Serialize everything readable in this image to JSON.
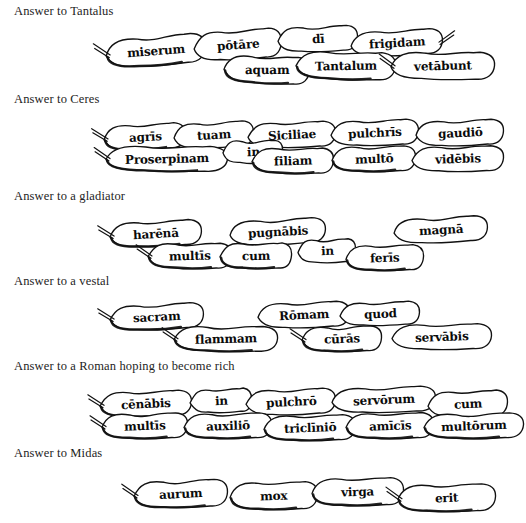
{
  "page": {
    "background_color": "#ffffff",
    "ink_color": "#111111"
  },
  "groups": [
    {
      "id": "tantalus",
      "heading": "Answer to Tantalus",
      "top": 4,
      "upper_row": [
        {
          "word": "miserum",
          "x": 104,
          "y": 16,
          "w": 104,
          "h": 34,
          "rot": -4,
          "tail": "left",
          "shade": true
        },
        {
          "word": "pōtāre",
          "x": 192,
          "y": 10,
          "w": 92,
          "h": 34,
          "rot": -3,
          "tail": "none",
          "shade": false
        },
        {
          "word": "dī",
          "x": 276,
          "y": 6,
          "w": 84,
          "h": 30,
          "rot": -1,
          "tail": "none",
          "shade": false
        },
        {
          "word": "frigidam",
          "x": 349,
          "y": 10,
          "w": 96,
          "h": 30,
          "rot": -2,
          "tail": "right",
          "shade": false
        }
      ],
      "lower_row": [
        {
          "word": "aquam",
          "x": 222,
          "y": 36,
          "w": 90,
          "h": 32,
          "rot": 3,
          "tail": "none",
          "shade": true
        },
        {
          "word": "Tantalum",
          "x": 294,
          "y": 32,
          "w": 104,
          "h": 32,
          "rot": 2,
          "tail": "none",
          "shade": true
        },
        {
          "word": "vetābunt",
          "x": 389,
          "y": 32,
          "w": 108,
          "h": 32,
          "rot": 1,
          "tail": "left",
          "shade": false
        }
      ]
    },
    {
      "id": "ceres",
      "heading": "Answer to Ceres",
      "top": 92,
      "upper_row": [
        {
          "word": "agrīs",
          "x": 102,
          "y": 16,
          "w": 86,
          "h": 30,
          "rot": -2,
          "tail": "left",
          "shade": true
        },
        {
          "word": "tuam",
          "x": 172,
          "y": 14,
          "w": 84,
          "h": 30,
          "rot": -2,
          "tail": "none",
          "shade": false
        },
        {
          "word": "Siciliae",
          "x": 246,
          "y": 14,
          "w": 92,
          "h": 30,
          "rot": -1,
          "tail": "none",
          "shade": false
        },
        {
          "word": "pulchrīs",
          "x": 329,
          "y": 12,
          "w": 92,
          "h": 30,
          "rot": -1,
          "tail": "none",
          "shade": false
        },
        {
          "word": "gaudiō",
          "x": 414,
          "y": 12,
          "w": 92,
          "h": 30,
          "rot": -1,
          "tail": "none",
          "shade": false
        }
      ],
      "lower_row": [
        {
          "word": "Proserpinam",
          "x": 104,
          "y": 38,
          "w": 126,
          "h": 30,
          "rot": 1,
          "tail": "left",
          "shade": true
        },
        {
          "word": "in",
          "x": 221,
          "y": 32,
          "w": 64,
          "h": 28,
          "rot": 1,
          "tail": "none",
          "shade": false
        },
        {
          "word": "filiam",
          "x": 250,
          "y": 40,
          "w": 86,
          "h": 30,
          "rot": 1,
          "tail": "none",
          "shade": true
        },
        {
          "word": "multō",
          "x": 330,
          "y": 38,
          "w": 88,
          "h": 30,
          "rot": 0,
          "tail": "none",
          "shade": true
        },
        {
          "word": "vidēbis",
          "x": 410,
          "y": 38,
          "w": 96,
          "h": 30,
          "rot": 0,
          "tail": "none",
          "shade": false
        }
      ]
    },
    {
      "id": "gladiator",
      "heading": "Answer to a gladiator",
      "top": 189,
      "upper_row": [
        {
          "word": "harēnā",
          "x": 108,
          "y": 16,
          "w": 96,
          "h": 30,
          "rot": -2,
          "tail": "left",
          "shade": true
        },
        {
          "word": "pugnābis",
          "x": 228,
          "y": 14,
          "w": 100,
          "h": 30,
          "rot": -2,
          "tail": "none",
          "shade": false
        },
        {
          "word": "magnā",
          "x": 392,
          "y": 12,
          "w": 98,
          "h": 30,
          "rot": -2,
          "tail": "none",
          "shade": false
        }
      ],
      "lower_row": [
        {
          "word": "multīs",
          "x": 146,
          "y": 38,
          "w": 88,
          "h": 30,
          "rot": 1,
          "tail": "left",
          "shade": true
        },
        {
          "word": "cum",
          "x": 218,
          "y": 38,
          "w": 76,
          "h": 30,
          "rot": 1,
          "tail": "none",
          "shade": true
        },
        {
          "word": "in",
          "x": 296,
          "y": 34,
          "w": 62,
          "h": 28,
          "rot": 0,
          "tail": "none",
          "shade": false
        },
        {
          "word": "ferīs",
          "x": 344,
          "y": 40,
          "w": 82,
          "h": 30,
          "rot": 0,
          "tail": "none",
          "shade": true
        }
      ]
    },
    {
      "id": "vestal",
      "heading": "Answer to a vestal",
      "top": 274,
      "upper_row": [
        {
          "word": "sacram",
          "x": 108,
          "y": 14,
          "w": 98,
          "h": 30,
          "rot": -2,
          "tail": "left",
          "shade": true
        },
        {
          "word": "Rōmam",
          "x": 256,
          "y": 12,
          "w": 96,
          "h": 30,
          "rot": -1,
          "tail": "none",
          "shade": false
        },
        {
          "word": "quod",
          "x": 338,
          "y": 12,
          "w": 84,
          "h": 28,
          "rot": -1,
          "tail": "none",
          "shade": false
        }
      ],
      "lower_row": [
        {
          "word": "flammam",
          "x": 172,
          "y": 36,
          "w": 108,
          "h": 30,
          "rot": 1,
          "tail": "left",
          "shade": true
        },
        {
          "word": "cūrās",
          "x": 300,
          "y": 36,
          "w": 84,
          "h": 30,
          "rot": 0,
          "tail": "left",
          "shade": true
        },
        {
          "word": "servābis",
          "x": 390,
          "y": 34,
          "w": 104,
          "h": 30,
          "rot": 0,
          "tail": "none",
          "shade": false
        }
      ]
    },
    {
      "id": "rich-roman",
      "heading": "Answer to a Roman hoping to become rich",
      "top": 359,
      "upper_row": [
        {
          "word": "cēnābis",
          "x": 98,
          "y": 16,
          "w": 96,
          "h": 30,
          "rot": -1,
          "tail": "left",
          "shade": true
        },
        {
          "word": "in",
          "x": 188,
          "y": 14,
          "w": 66,
          "h": 28,
          "rot": -1,
          "tail": "none",
          "shade": false
        },
        {
          "word": "pulchrō",
          "x": 244,
          "y": 14,
          "w": 94,
          "h": 30,
          "rot": -1,
          "tail": "none",
          "shade": false
        },
        {
          "word": "servōrum",
          "x": 330,
          "y": 12,
          "w": 108,
          "h": 30,
          "rot": -1,
          "tail": "none",
          "shade": false
        },
        {
          "word": "cum",
          "x": 426,
          "y": 16,
          "w": 84,
          "h": 30,
          "rot": -1,
          "tail": "none",
          "shade": false
        }
      ],
      "lower_row": [
        {
          "word": "multīs",
          "x": 100,
          "y": 38,
          "w": 90,
          "h": 30,
          "rot": 0,
          "tail": "left",
          "shade": true
        },
        {
          "word": "auxiliō",
          "x": 182,
          "y": 38,
          "w": 92,
          "h": 30,
          "rot": 0,
          "tail": "none",
          "shade": true
        },
        {
          "word": "triclīniō",
          "x": 262,
          "y": 40,
          "w": 96,
          "h": 30,
          "rot": 0,
          "tail": "none",
          "shade": true
        },
        {
          "word": "amīcīs",
          "x": 344,
          "y": 38,
          "w": 92,
          "h": 30,
          "rot": 0,
          "tail": "none",
          "shade": true
        },
        {
          "word": "multōrum",
          "x": 422,
          "y": 38,
          "w": 104,
          "h": 30,
          "rot": 0,
          "tail": "none",
          "shade": true
        }
      ]
    },
    {
      "id": "midas",
      "heading": "Answer to Midas",
      "top": 446,
      "upper_row": [
        {
          "word": "aurum",
          "x": 132,
          "y": 18,
          "w": 98,
          "h": 32,
          "rot": -1,
          "tail": "left",
          "shade": true
        },
        {
          "word": "mox",
          "x": 228,
          "y": 20,
          "w": 92,
          "h": 32,
          "rot": 0,
          "tail": "none",
          "shade": true
        },
        {
          "word": "virga",
          "x": 310,
          "y": 16,
          "w": 96,
          "h": 32,
          "rot": 0,
          "tail": "none",
          "shade": true
        },
        {
          "word": "erit",
          "x": 396,
          "y": 22,
          "w": 102,
          "h": 32,
          "rot": 0,
          "tail": "left",
          "shade": true
        }
      ],
      "lower_row": []
    }
  ]
}
